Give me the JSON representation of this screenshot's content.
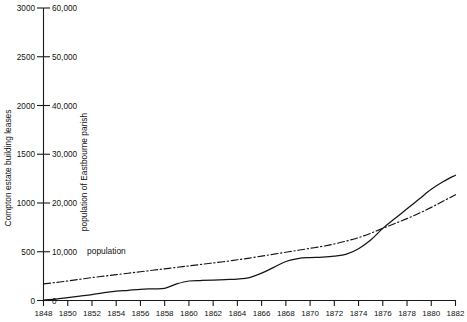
{
  "chart_data": {
    "type": "line",
    "title": "",
    "xlabel": "",
    "xlim": [
      1848,
      1882
    ],
    "grid": false,
    "legend_position": "inline-annotation",
    "x_ticks": [
      1848,
      1850,
      1852,
      1854,
      1856,
      1858,
      1860,
      1862,
      1864,
      1866,
      1868,
      1870,
      1872,
      1874,
      1876,
      1878,
      1880,
      1882
    ],
    "axes": [
      {
        "id": "left",
        "label": "Compton estate building leases",
        "ticks": [
          0,
          500,
          1000,
          1500,
          2000,
          2500,
          3000
        ],
        "tick_labels": [
          "0",
          "500",
          "1000",
          "1500",
          "2000",
          "2500",
          "3000"
        ],
        "lim": [
          0,
          3000
        ]
      },
      {
        "id": "right",
        "label": "population of Eastbourne parish",
        "ticks": [
          0,
          10000,
          20000,
          30000,
          40000,
          50000,
          60000
        ],
        "tick_labels": [
          "0",
          "10,000",
          "20,000",
          "30,000",
          "40,000",
          "50,000",
          "60,000"
        ],
        "lim": [
          0,
          60000
        ]
      }
    ],
    "annotations": [
      {
        "text": "population",
        "x": 1851.6,
        "y": 9600,
        "axis": "right"
      }
    ],
    "series": [
      {
        "name": "Compton estate building leases",
        "axis": "left",
        "style": "solid",
        "x": [
          1848,
          1849,
          1850,
          1851,
          1852,
          1853,
          1854,
          1855,
          1856,
          1857,
          1858,
          1859,
          1860,
          1861,
          1862,
          1863,
          1864,
          1865,
          1866,
          1867,
          1868,
          1869,
          1870,
          1871,
          1872,
          1873,
          1874,
          1875,
          1876,
          1877,
          1878,
          1879,
          1880,
          1881,
          1882
        ],
        "values": [
          5,
          15,
          30,
          45,
          60,
          80,
          95,
          105,
          115,
          120,
          125,
          170,
          200,
          205,
          210,
          215,
          220,
          235,
          280,
          340,
          400,
          430,
          440,
          445,
          455,
          475,
          530,
          620,
          740,
          840,
          940,
          1040,
          1140,
          1220,
          1285
        ]
      },
      {
        "name": "population",
        "axis": "right",
        "style": "dash-dot",
        "x": [
          1848,
          1849,
          1850,
          1851,
          1852,
          1853,
          1854,
          1855,
          1856,
          1857,
          1858,
          1859,
          1860,
          1861,
          1862,
          1863,
          1864,
          1865,
          1866,
          1867,
          1868,
          1869,
          1870,
          1871,
          1872,
          1873,
          1874,
          1875,
          1876,
          1877,
          1878,
          1879,
          1880,
          1881,
          1882
        ],
        "values": [
          3400,
          3700,
          4000,
          4350,
          4700,
          5000,
          5300,
          5600,
          5900,
          6200,
          6500,
          6800,
          7100,
          7400,
          7700,
          8000,
          8350,
          8700,
          9100,
          9500,
          9900,
          10300,
          10700,
          11100,
          11600,
          12200,
          12900,
          13800,
          14800,
          15800,
          16800,
          17900,
          19100,
          20400,
          21700
        ]
      }
    ]
  }
}
